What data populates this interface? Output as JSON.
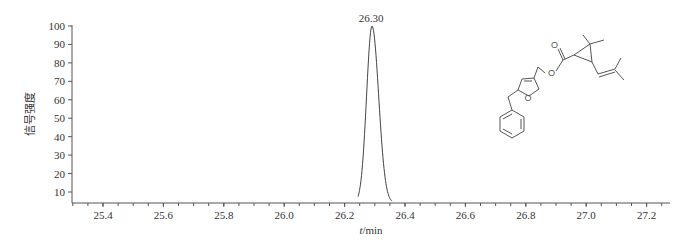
{
  "chart_data": {
    "type": "line",
    "title": "",
    "xlabel": "t/min",
    "xlabel_italic_part": "t",
    "xlabel_unit": "/min",
    "ylabel": "信号强度",
    "xlim": [
      25.29,
      27.31
    ],
    "ylim": [
      5,
      100
    ],
    "x_ticks": [
      25.4,
      25.6,
      25.8,
      26.0,
      26.2,
      26.4,
      26.6,
      26.8,
      27.0,
      27.2
    ],
    "x_tick_labels": [
      "25.4",
      "25.6",
      "25.8",
      "26.0",
      "26.2",
      "26.4",
      "26.6",
      "26.8",
      "27.0",
      "27.2"
    ],
    "x_minor_step": 0.05,
    "y_ticks": [
      10,
      20,
      30,
      40,
      50,
      60,
      70,
      80,
      90,
      100
    ],
    "y_tick_labels": [
      "10",
      "20",
      "30",
      "40",
      "50",
      "60",
      "70",
      "80",
      "90",
      "100"
    ],
    "grid": false,
    "legend": null,
    "series": [
      {
        "name": "chromatogram",
        "peak": {
          "x": 26.3,
          "y": 100,
          "sigma_left": 0.018,
          "sigma_right": 0.022
        },
        "baseline": 0
      }
    ],
    "annotations": [
      {
        "text": "26.30",
        "x": 26.3,
        "y": 100,
        "position": "above-peak"
      }
    ],
    "inset": "chemical structure of resmethrin (5-benzyl-3-furylmethyl chrysanthemate)"
  },
  "colors": {
    "line": "#444444",
    "axis": "#555555",
    "text": "#333333"
  }
}
